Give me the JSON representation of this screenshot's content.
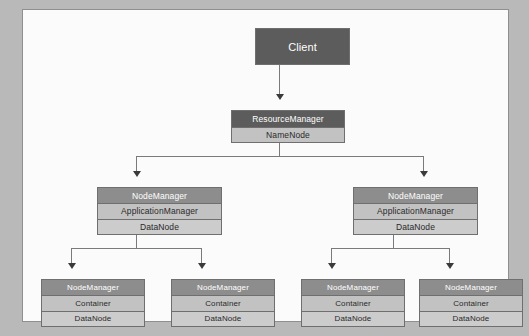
{
  "diagram": {
    "type": "hierarchy-tree",
    "background_color": "#b9b9b9",
    "frame_color": "#8f8f8f",
    "frame_fill": "#fbfbfb",
    "connector_color": "#7a7a7a",
    "arrowhead_color": "#3a3a3a"
  },
  "palette": {
    "dark_gray": "#5c5c5c",
    "medium_gray": "#8d8d8d",
    "light_gray": "#c2c2c2",
    "lighter_gray": "#cccccc",
    "text_on_dark": "#ffffff",
    "text_on_light": "#2a2a2a",
    "box_border": "#6f6f6f"
  },
  "tiers": {
    "client": {
      "label": "Client",
      "rows": [
        "Client"
      ]
    },
    "master": {
      "rows": [
        "ResourceManager",
        "NameNode"
      ]
    },
    "middle": [
      {
        "rows": [
          "NodeManager",
          "ApplicationManager",
          "DataNode"
        ]
      },
      {
        "rows": [
          "NodeManager",
          "ApplicationManager",
          "DataNode"
        ]
      }
    ],
    "leaves": [
      {
        "rows": [
          "NodeManager",
          "Container",
          "DataNode"
        ]
      },
      {
        "rows": [
          "NodeManager",
          "Container",
          "DataNode"
        ]
      },
      {
        "rows": [
          "NodeManager",
          "Container",
          "DataNode"
        ]
      },
      {
        "rows": [
          "NodeManager",
          "Container",
          "DataNode"
        ]
      }
    ]
  },
  "connectors": [
    {
      "from": "client",
      "to": "master"
    },
    {
      "from": "master",
      "to": "middle-left"
    },
    {
      "from": "master",
      "to": "middle-right"
    },
    {
      "from": "middle-left",
      "to": "leaf-1"
    },
    {
      "from": "middle-left",
      "to": "leaf-2"
    },
    {
      "from": "middle-right",
      "to": "leaf-3"
    },
    {
      "from": "middle-right",
      "to": "leaf-4"
    }
  ]
}
